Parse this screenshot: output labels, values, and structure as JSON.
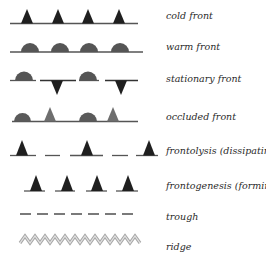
{
  "legend": {
    "items": [
      {
        "id": "cold",
        "label": "cold front"
      },
      {
        "id": "warm",
        "label": "warm front"
      },
      {
        "id": "stationary",
        "label": "stationary front"
      },
      {
        "id": "occluded",
        "label": "occluded front"
      },
      {
        "id": "frontolysis",
        "label": "frontolysis (dissipating)"
      },
      {
        "id": "frontogenesis",
        "label": "frontogenesis (forming)"
      },
      {
        "id": "trough",
        "label": "trough"
      },
      {
        "id": "ridge",
        "label": "ridge"
      }
    ]
  },
  "colors": {
    "line": "#555555",
    "triangle_dark": "#1f1f1f",
    "semicircle": "#555555",
    "occluded_triangle": "#6e6e6e",
    "trough": "#7a7a7a",
    "ridge": "#b5b5b5",
    "label": "#2a2a2a"
  }
}
